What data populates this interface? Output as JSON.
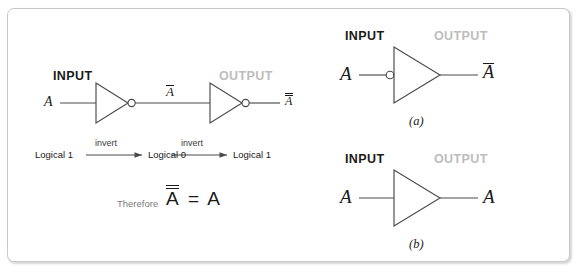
{
  "figure": {
    "background_color": "#ffffff",
    "frame_border_color": "#c9c9c9",
    "line_color": "#4a4a4a",
    "input_label_color": "#1a1a1a",
    "output_label_color": "#bdbdbd"
  },
  "main_diagram": {
    "input_header": "INPUT",
    "output_header": "OUTPUT",
    "input_signal": "A",
    "middle_signal": "A",
    "middle_signal_bars": 1,
    "output_signal": "A",
    "output_signal_bars": 2,
    "gate1_type": "inverter",
    "gate2_type": "inverter"
  },
  "logical_chain": {
    "step1": "Logical 1",
    "arrow1_label": "invert",
    "step2": "Logical 0",
    "arrow2_label": "invert",
    "step3": "Logical 1"
  },
  "conclusion": {
    "therefore_word": "Therefore",
    "left_term": "A",
    "left_term_bars": 2,
    "equals": "=",
    "right_term": "A"
  },
  "sub_figures": [
    {
      "caption": "(a)",
      "input_header": "INPUT",
      "output_header": "OUTPUT",
      "input_signal": "A",
      "output_signal": "A",
      "output_signal_bars": 1,
      "gate_type": "inverter",
      "bubble_side": "input"
    },
    {
      "caption": "(b)",
      "input_header": "INPUT",
      "output_header": "OUTPUT",
      "input_signal": "A",
      "output_signal": "A",
      "output_signal_bars": 0,
      "gate_type": "buffer",
      "bubble_side": "none"
    }
  ]
}
